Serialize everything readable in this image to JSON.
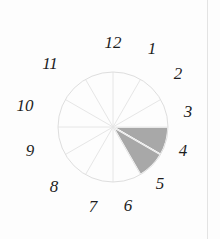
{
  "figure": {
    "kind": "clock-dial",
    "background_color": "#fdfdfd",
    "rule_color": "#e3e3e3"
  },
  "dial": {
    "center_x": 113,
    "center_y": 127,
    "radius": 55,
    "sector_count": 12,
    "outline_color": "#dedede",
    "spoke_color": "#e6e6e6",
    "shaded_color": "#a8a8a8",
    "divider_color": "#ffffff"
  },
  "chart_data": {
    "type": "pie",
    "xlabel": "",
    "ylabel": "",
    "categories": [
      "12",
      "1",
      "2",
      "3",
      "4",
      "5",
      "6",
      "7",
      "8",
      "9",
      "10",
      "11"
    ],
    "values": [
      1,
      1,
      1,
      1,
      1,
      1,
      1,
      1,
      1,
      1,
      1,
      1
    ],
    "highlighted": [
      "3",
      "4"
    ],
    "highlight_color": "#a8a8a8",
    "unfilled_color": "#ffffff",
    "legend": "none",
    "grid": false
  },
  "hours": [
    {
      "label": "12",
      "x": 113,
      "y": 42
    },
    {
      "label": "1",
      "x": 152,
      "y": 48
    },
    {
      "label": "2",
      "x": 178,
      "y": 73
    },
    {
      "label": "3",
      "x": 188,
      "y": 111
    },
    {
      "label": "4",
      "x": 183,
      "y": 150
    },
    {
      "label": "5",
      "x": 160,
      "y": 183
    },
    {
      "label": "6",
      "x": 128,
      "y": 205
    },
    {
      "label": "7",
      "x": 93,
      "y": 206
    },
    {
      "label": "8",
      "x": 54,
      "y": 186
    },
    {
      "label": "9",
      "x": 30,
      "y": 150
    },
    {
      "label": "10",
      "x": 25,
      "y": 105
    },
    {
      "label": "11",
      "x": 50,
      "y": 63
    }
  ]
}
